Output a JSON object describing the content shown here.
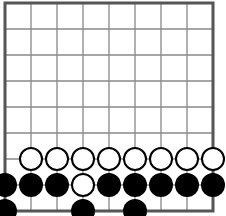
{
  "board": {
    "size": 9,
    "origin": {
      "x": 5,
      "y": 3
    },
    "spacing": 26,
    "stone_radius": 11.5,
    "colors": {
      "line": "#888888",
      "border": "#555555",
      "black_stone": "#000000",
      "white_stone_fill": "#ffffff",
      "white_stone_stroke": "#000000",
      "background": "#ffffff"
    },
    "stones": [
      {
        "col": 1,
        "row": 6,
        "color": "white"
      },
      {
        "col": 2,
        "row": 6,
        "color": "white"
      },
      {
        "col": 3,
        "row": 6,
        "color": "white"
      },
      {
        "col": 4,
        "row": 6,
        "color": "white"
      },
      {
        "col": 5,
        "row": 6,
        "color": "white"
      },
      {
        "col": 6,
        "row": 6,
        "color": "white"
      },
      {
        "col": 7,
        "row": 6,
        "color": "white"
      },
      {
        "col": 8,
        "row": 6,
        "color": "white"
      },
      {
        "col": 0,
        "row": 7,
        "color": "black"
      },
      {
        "col": 1,
        "row": 7,
        "color": "black"
      },
      {
        "col": 2,
        "row": 7,
        "color": "black"
      },
      {
        "col": 3,
        "row": 7,
        "color": "white"
      },
      {
        "col": 4,
        "row": 7,
        "color": "black"
      },
      {
        "col": 5,
        "row": 7,
        "color": "black"
      },
      {
        "col": 6,
        "row": 7,
        "color": "black"
      },
      {
        "col": 7,
        "row": 7,
        "color": "black"
      },
      {
        "col": 8,
        "row": 7,
        "color": "black"
      },
      {
        "col": 0,
        "row": 8,
        "color": "black"
      },
      {
        "col": 3,
        "row": 8,
        "color": "black"
      },
      {
        "col": 5,
        "row": 8,
        "color": "black"
      }
    ]
  }
}
